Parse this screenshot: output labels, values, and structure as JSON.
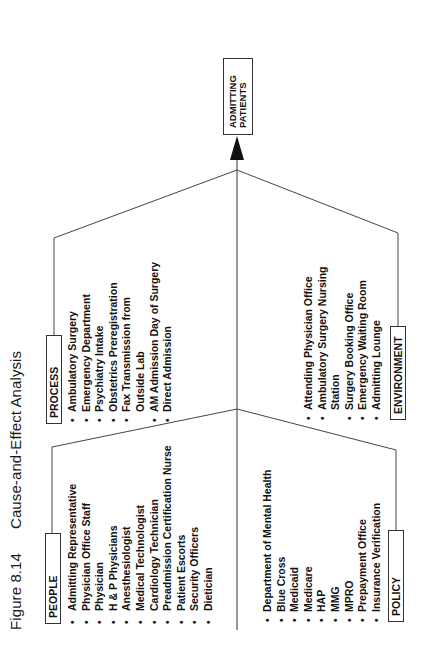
{
  "figure": {
    "number": "Figure 8.14",
    "title": "Cause-and-Effect Analysis"
  },
  "effect": {
    "line1": "ADMITTING",
    "line2": "PATIENTS"
  },
  "categories": {
    "people": {
      "label": "PEOPLE",
      "items": [
        {
          "text": "Admitting Representative",
          "bullet": true
        },
        {
          "text": "Physician Office Staff",
          "bullet": true
        },
        {
          "text": "Physician",
          "bullet": true
        },
        {
          "text": "H & P Physicians",
          "bullet": true
        },
        {
          "text": "Anesthesiologist",
          "bullet": true
        },
        {
          "text": "Medical Technologist",
          "bullet": true
        },
        {
          "text": "Cardiology Technician",
          "bullet": true
        },
        {
          "text": "Preadmission Certification Nurse",
          "bullet": true
        },
        {
          "text": "Patient Escorts",
          "bullet": true
        },
        {
          "text": "Security Officers",
          "bullet": true
        },
        {
          "text": "Dietician",
          "bullet": true
        }
      ]
    },
    "process": {
      "label": "PROCESS",
      "items": [
        {
          "text": "Ambulatory Surgery",
          "bullet": true
        },
        {
          "text": "Emergency Department",
          "bullet": true
        },
        {
          "text": "Psychiatry Intake",
          "bullet": true
        },
        {
          "text": "Obstetrics Preregistration",
          "bullet": true
        },
        {
          "text": "Fax Transmission from",
          "bullet": true
        },
        {
          "text": "Outside Lab",
          "bullet": false
        },
        {
          "text": "AM Admission Day of Surgery",
          "bullet": true
        },
        {
          "text": "Direct Admission",
          "bullet": true
        }
      ]
    },
    "policy": {
      "label": "POLICY",
      "items": [
        {
          "text": "Department of Mental Health",
          "bullet": true
        },
        {
          "text": "Blue Cross",
          "bullet": true
        },
        {
          "text": "Medicaid",
          "bullet": true
        },
        {
          "text": "Medicare",
          "bullet": true
        },
        {
          "text": "HAP",
          "bullet": true
        },
        {
          "text": "MMG",
          "bullet": true
        },
        {
          "text": "MPRO",
          "bullet": true
        },
        {
          "text": "Prepayment Office",
          "bullet": true
        },
        {
          "text": "Insurance Verification",
          "bullet": true
        }
      ]
    },
    "environment": {
      "label": "ENVIRONMENT",
      "items": [
        {
          "text": "Attending Physician Office",
          "bullet": true
        },
        {
          "text": "Ambulatory Surgery Nursing",
          "bullet": true
        },
        {
          "text": "Station",
          "bullet": false
        },
        {
          "text": "Surgery Booking Office",
          "bullet": true
        },
        {
          "text": "Emergency Waiting Room",
          "bullet": true
        },
        {
          "text": "Admitting Lounge",
          "bullet": true
        }
      ]
    }
  },
  "colors": {
    "line": "#444444",
    "text": "#111111",
    "background": "#ffffff"
  }
}
